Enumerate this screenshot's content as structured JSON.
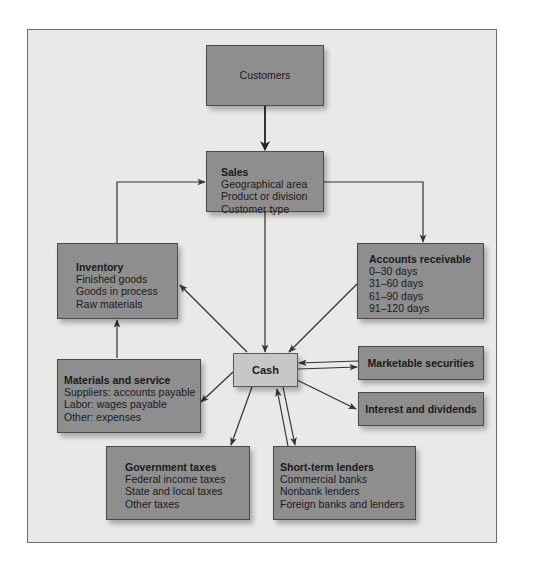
{
  "diagram": {
    "type": "cash-flow-diagram",
    "colors": {
      "frame_background": "#e9e9e8",
      "box_fill": "#8e8e8e",
      "cash_fill": "#c7c7c7",
      "line": "#333333"
    },
    "nodes": {
      "customers": {
        "title": "Customers"
      },
      "sales": {
        "title": "Sales",
        "items": [
          "Geographical area",
          "Product or division",
          "Customer type"
        ]
      },
      "inventory": {
        "title": "Inventory",
        "items": [
          "Finished goods",
          "Goods in process",
          "Raw materials"
        ]
      },
      "accounts_receivable": {
        "title": "Accounts receivable",
        "items": [
          "0–30 days",
          "31–60 days",
          "61–90 days",
          "91–120 days"
        ]
      },
      "cash": {
        "title": "Cash"
      },
      "materials_service": {
        "title": "Materials and service",
        "items": [
          "Suppliers: accounts payable",
          "Labor: wages payable",
          "Other: expenses"
        ]
      },
      "marketable_securities": {
        "title": "Marketable securities"
      },
      "interest_dividends": {
        "title": "Interest and dividends"
      },
      "government_taxes": {
        "title": "Government taxes",
        "items": [
          "Federal income taxes",
          "State and local taxes",
          "Other taxes"
        ]
      },
      "short_term_lenders": {
        "title": "Short-term lenders",
        "items": [
          "Commercial banks",
          "Nonbank lenders",
          "Foreign banks and lenders"
        ]
      }
    },
    "edges": [
      {
        "from": "Customers",
        "to": "Sales"
      },
      {
        "from": "Sales",
        "to": "Cash"
      },
      {
        "from": "Sales",
        "to": "Accounts receivable"
      },
      {
        "from": "Inventory",
        "to": "Sales"
      },
      {
        "from": "Accounts receivable",
        "to": "Cash"
      },
      {
        "from": "Cash",
        "to": "Inventory"
      },
      {
        "from": "Materials and service",
        "to": "Inventory"
      },
      {
        "from": "Cash",
        "to": "Materials and service"
      },
      {
        "from": "Cash",
        "to": "Marketable securities"
      },
      {
        "from": "Marketable securities",
        "to": "Cash"
      },
      {
        "from": "Cash",
        "to": "Interest and dividends"
      },
      {
        "from": "Cash",
        "to": "Government taxes"
      },
      {
        "from": "Cash",
        "to": "Short-term lenders"
      },
      {
        "from": "Short-term lenders",
        "to": "Cash"
      }
    ]
  }
}
